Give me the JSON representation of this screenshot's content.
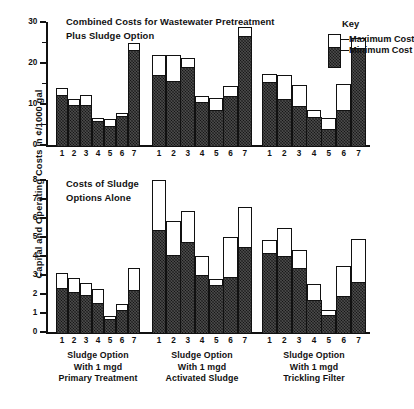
{
  "figure": {
    "ylabel": "Capital and Operating Costs in ¢/1000 gal"
  },
  "key": {
    "title": "Key",
    "max_label": "Maximum Cost",
    "min_label": "Minimum Cost",
    "max_color": "#ffffff",
    "min_color": "#141414"
  },
  "panels": {
    "top": {
      "title_line1": "Combined Costs for Wastewater Pretreatment",
      "title_line2": "Plus  Sludge Option",
      "ytick_labels": [
        "0",
        "10",
        "20",
        "30"
      ]
    },
    "bottom": {
      "title_line1": "Costs of Sludge",
      "title_line2": "Options Alone",
      "ytick_labels": [
        "0",
        "1",
        "2",
        "3",
        "4",
        "5",
        "6",
        "7",
        "8"
      ]
    }
  },
  "group_captions": [
    {
      "line1": "Sludge Option",
      "line2": "With 1 mgd",
      "line3": "Primary Treatment"
    },
    {
      "line1": "Sludge Option",
      "line2": "With 1 mgd",
      "line3": "Activated Sludge"
    },
    {
      "line1": "Sludge Option",
      "line2": "With 1 mgd",
      "line3": "Trickling Filter"
    }
  ],
  "xtick_labels": [
    "1",
    "2",
    "3",
    "4",
    "5",
    "6",
    "7"
  ],
  "chart_data": [
    {
      "type": "bar",
      "id": "combined-costs",
      "title": "Combined Costs for Wastewater Pretreatment Plus Sludge Option",
      "xlabel": "Sludge Option",
      "ylabel": "Capital and Operating Costs in ¢/1000 gal",
      "ylim": [
        0,
        30
      ],
      "yticks": [
        0,
        10,
        20,
        30
      ],
      "grid": false,
      "legend": [
        "Maximum Cost",
        "Minimum Cost"
      ],
      "legend_position": "top-right",
      "categories": [
        "1",
        "2",
        "3",
        "4",
        "5",
        "6",
        "7"
      ],
      "groups": [
        {
          "name": "Sludge Option With 1 mgd Primary Treatment",
          "series": [
            {
              "name": "Minimum Cost",
              "values": [
                12.7,
                10.3,
                10.4,
                6.3,
                5.1,
                7.7,
                23.7
              ]
            },
            {
              "name": "Maximum Cost",
              "values": [
                14.5,
                11.8,
                12.8,
                7.0,
                6.8,
                8.3,
                25.3
              ]
            }
          ]
        },
        {
          "name": "Sludge Option With 1 mgd Activated Sludge",
          "series": [
            {
              "name": "Minimum Cost",
              "values": [
                17.6,
                16.2,
                19.5,
                11.1,
                9.0,
                12.5,
                27.1
              ]
            },
            {
              "name": "Maximum Cost",
              "values": [
                22.5,
                22.5,
                21.8,
                12.5,
                11.9,
                15.0,
                29.3
              ]
            }
          ]
        },
        {
          "name": "Sludge Option With 1 mgd Trickling Filter",
          "series": [
            {
              "name": "Minimum Cost",
              "values": [
                15.8,
                11.7,
                10.0,
                7.4,
                4.5,
                9.0,
                24.2
              ]
            },
            {
              "name": "Maximum Cost",
              "values": [
                17.7,
                17.5,
                15.2,
                9.0,
                7.0,
                15.4,
                26.7
              ]
            }
          ]
        }
      ]
    },
    {
      "type": "bar",
      "id": "sludge-only-costs",
      "title": "Costs of Sludge Options Alone",
      "xlabel": "Sludge Option",
      "ylabel": "Capital and Operating Costs in ¢/1000 gal",
      "ylim": [
        0,
        8
      ],
      "yticks": [
        0,
        1,
        2,
        3,
        4,
        5,
        6,
        7,
        8
      ],
      "grid": false,
      "legend": [
        "Maximum Cost",
        "Minimum Cost"
      ],
      "categories": [
        "1",
        "2",
        "3",
        "4",
        "5",
        "6",
        "7"
      ],
      "groups": [
        {
          "name": "Sludge Option With 1 mgd Primary Treatment",
          "series": [
            {
              "name": "Minimum Cost",
              "values": [
                2.45,
                2.2,
                2.05,
                1.65,
                0.8,
                1.25,
                2.35
              ]
            },
            {
              "name": "Maximum Cost",
              "values": [
                3.2,
                2.95,
                2.7,
                2.35,
                0.95,
                1.6,
                3.5
              ]
            }
          ]
        },
        {
          "name": "Sludge Option With 1 mgd Activated Sludge",
          "series": [
            {
              "name": "Minimum Cost",
              "values": [
                5.5,
                4.15,
                4.85,
                3.1,
                2.6,
                3.0,
                4.6
              ]
            },
            {
              "name": "Maximum Cost",
              "values": [
                8.1,
                5.95,
                6.45,
                4.1,
                2.9,
                5.1,
                6.7
              ]
            }
          ]
        },
        {
          "name": "Sludge Option With 1 mgd Trickling Filter",
          "series": [
            {
              "name": "Minimum Cost",
              "values": [
                4.3,
                4.1,
                3.5,
                1.8,
                1.0,
                2.0,
                2.75
              ]
            },
            {
              "name": "Maximum Cost",
              "values": [
                4.95,
                5.6,
                4.4,
                2.65,
                1.25,
                3.6,
                5.0
              ]
            }
          ]
        }
      ]
    }
  ]
}
